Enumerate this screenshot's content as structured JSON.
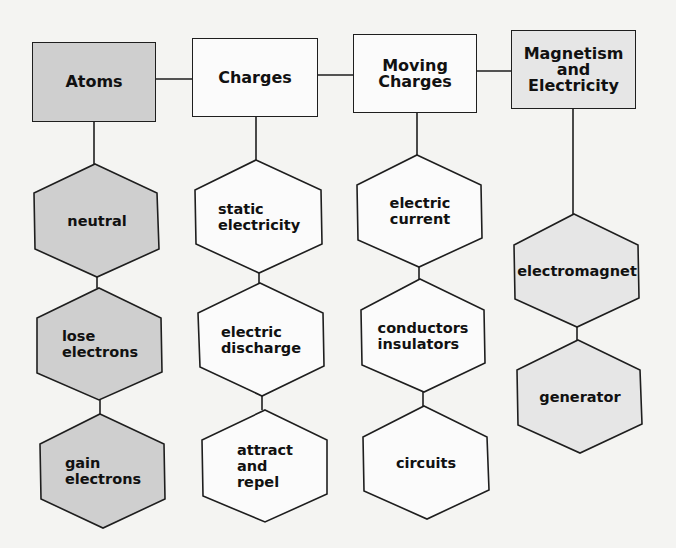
{
  "colors": {
    "background": "#f4f4f2",
    "gray_fill": "#cfcfcf",
    "light_gray_fill": "#e6e6e6",
    "white_fill": "#fbfbfb",
    "stroke": "#1e1e1e"
  },
  "columns": [
    {
      "title": "Atoms",
      "fill": "gray",
      "items": [
        "neutral",
        "lose\nelectrons",
        "gain\nelectrons"
      ]
    },
    {
      "title": "Charges",
      "fill": "white",
      "items": [
        "static\nelectricity",
        "electric\ndischarge",
        "attract\nand\nrepel"
      ]
    },
    {
      "title": "Moving\nCharges",
      "fill": "white",
      "items": [
        "electric\ncurrent",
        "conductors\ninsulators",
        "circuits"
      ]
    },
    {
      "title": "Magnetism\nand\nElectricity",
      "fill": "light_gray",
      "items": [
        "electromagnet",
        "generator"
      ]
    }
  ]
}
